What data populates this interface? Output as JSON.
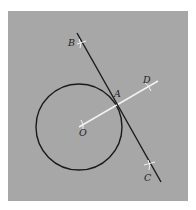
{
  "figure": {
    "colors": {
      "background": "#a7a7a7",
      "border": "#ffffff",
      "circle": "#1a1a1a",
      "tangent_line": "#1a1a1a",
      "radius_line": "#f2f2f2",
      "tick_marks": "#f2f2f2",
      "labels": "#1e1e1e"
    },
    "points": {
      "B": {
        "label": "B"
      },
      "A": {
        "label": "A"
      },
      "C": {
        "label": "C"
      },
      "D": {
        "label": "D"
      },
      "O": {
        "label": "O"
      }
    },
    "elements": [
      {
        "type": "circle",
        "name": "circle",
        "center": "O",
        "through": "A"
      },
      {
        "type": "line",
        "name": "tangent",
        "from": "B",
        "to": "C",
        "touches": "A"
      },
      {
        "type": "segment",
        "name": "radius-extended",
        "from": "O",
        "to": "D",
        "through": "A"
      }
    ]
  }
}
